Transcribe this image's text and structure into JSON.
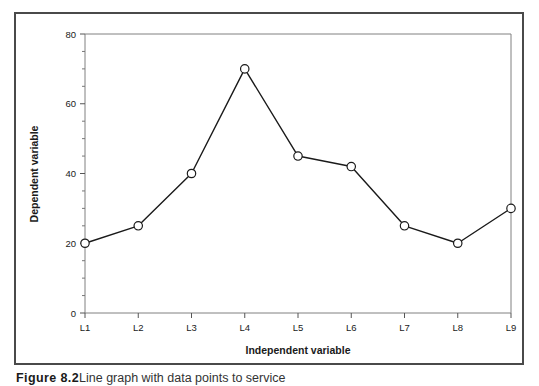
{
  "figure": {
    "caption_label": "Figure 8.2",
    "caption_text": "Line graph with data points to service",
    "frame_color": "#4a4a4a",
    "background_color": "#ffffff"
  },
  "chart_data": {
    "type": "line",
    "title": "",
    "xlabel": "Independent variable",
    "ylabel": "Dependent variable",
    "categories": [
      "L1",
      "L2",
      "L3",
      "L4",
      "L5",
      "L6",
      "L7",
      "L8",
      "L9"
    ],
    "values": [
      20,
      25,
      40,
      70,
      45,
      42,
      25,
      20,
      30
    ],
    "series": [
      {
        "name": "",
        "values": [
          20,
          25,
          40,
          70,
          45,
          42,
          25,
          20,
          30
        ],
        "line_color": "#1a1a1a",
        "marker": "open-circle",
        "marker_fill": "#ffffff"
      }
    ],
    "ylim": [
      0,
      80
    ],
    "y_major_ticks": [
      0,
      20,
      40,
      60,
      80
    ],
    "y_minor_tick_step": 5,
    "y_tick_labels": [
      "0",
      "20",
      "40",
      "60",
      "80"
    ],
    "grid": false,
    "legend": "none",
    "axis_color": "#808080"
  }
}
